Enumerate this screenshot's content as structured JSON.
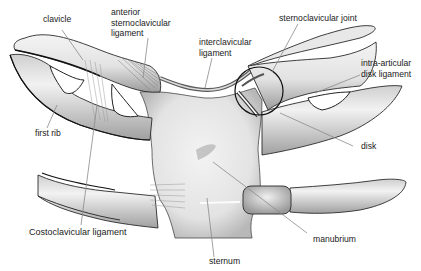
{
  "diagram": {
    "labels": {
      "clavicle": "clavicle",
      "anterior_sc_ligament": [
        "anterior",
        "sternoclavicular",
        "ligament"
      ],
      "interclavicular_ligament": [
        "interclavicular",
        "ligament"
      ],
      "sc_joint": "sternoclavicular joint",
      "intra_articular_disk_ligament": [
        "intra-articular",
        "disk ligament"
      ],
      "first_rib": "first rib",
      "costoclavicular_ligament": "Costoclavicular ligament",
      "disk": "disk",
      "manubrium": "manubrium",
      "sternum": "sternum"
    },
    "colors": {
      "bone_fill": "#ececec",
      "bone_shade": "#bdbdbd",
      "outline": "#222222",
      "leader_line": "#8a8a8a",
      "label_text": "#1a1a1a",
      "joint_circle": "#111111"
    }
  }
}
